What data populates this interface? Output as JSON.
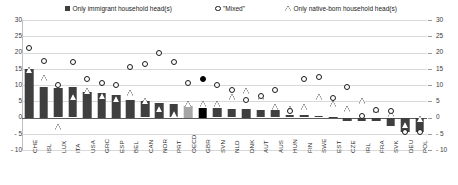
{
  "chart_data": {
    "type": "bar",
    "title": "",
    "xlabel": "",
    "ylabel": "",
    "ylim": [
      -10,
      30
    ],
    "yticks": [
      30,
      25,
      20,
      15,
      10,
      5,
      0,
      -5,
      -10
    ],
    "ytick_labels_left": [
      "30",
      "25",
      "20",
      "15",
      "10",
      "5",
      "0",
      "- 5",
      "- 10"
    ],
    "ytick_labels_right": [
      "30",
      "25",
      "20",
      "15",
      "10",
      "5",
      "0",
      "- 5",
      "- 10"
    ],
    "grid": true,
    "legend_position": "top",
    "categories": [
      "CHE",
      "ISL",
      "LUX",
      "ITA",
      "USA",
      "GRC",
      "ESP",
      "BEL",
      "CAN",
      "NOR",
      "PRT",
      "OECD",
      "GBR",
      "SVN",
      "NLD",
      "DNK",
      "AUT",
      "AUS",
      "HUN",
      "FIN",
      "SWE",
      "EST",
      "CZE",
      "IRL",
      "FRA",
      "SVK",
      "DEU",
      "POL"
    ],
    "series": [
      {
        "name": "Only immigrant household head(s)",
        "marker": "filled-square",
        "color": "#3f3f3f",
        "highlight_colors": {
          "OECD": "#a6a6a6",
          "GBR": "#000000"
        },
        "values": [
          15.0,
          9.5,
          9.2,
          9.3,
          8.0,
          7.5,
          7.0,
          5.5,
          5.2,
          4.5,
          4.3,
          3.5,
          3.0,
          2.8,
          2.6,
          2.5,
          2.4,
          2.3,
          0.9,
          0.7,
          0.4,
          0.1,
          -1.0,
          -1.2,
          -1.1,
          -2.5,
          -4.6,
          -4.5
        ]
      },
      {
        "name": "\"Mixed\"",
        "marker": "open-circle",
        "color": "#1a1a1a",
        "highlight_colors": {
          "GBR": "#000000"
        },
        "values": [
          21.5,
          17.5,
          10.0,
          17.0,
          12.0,
          10.5,
          10.0,
          15.5,
          16.5,
          20.0,
          17.0,
          10.5,
          12.0,
          10.0,
          8.5,
          5.5,
          6.5,
          8.5,
          2.0,
          12.0,
          12.5,
          6.0,
          9.5,
          0.5,
          2.2,
          2.0,
          -4.6,
          -4.5
        ]
      },
      {
        "name": "Only native-born household head(s)",
        "marker": "open-triangle",
        "color": "#1a1a1a",
        "values": [
          15.0,
          12.5,
          -2.5,
          6.5,
          8.5,
          7.0,
          6.0,
          8.0,
          5.5,
          3.0,
          1.5,
          4.5,
          4.5,
          4.5,
          6.5,
          8.5,
          6.5,
          3.5,
          3.0,
          3.5,
          6.5,
          4.5,
          3.0,
          5.5,
          2.5,
          1.5,
          -2.0,
          0.0
        ]
      }
    ]
  },
  "legend": {
    "items": [
      {
        "label": "Only immigrant household head(s)",
        "marker": "filled-square"
      },
      {
        "label": "\"Mixed\"",
        "marker": "open-circle"
      },
      {
        "label": "Only native-born household head(s)",
        "marker": "open-triangle"
      }
    ]
  }
}
